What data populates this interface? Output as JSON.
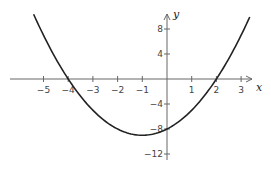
{
  "chart_data": {
    "type": "line",
    "title": "",
    "xlabel": "x",
    "ylabel": "y",
    "function": "y = x^2 + 2x - 8",
    "x_ticks": [
      -5,
      -4,
      -3,
      -2,
      -1,
      1,
      2,
      3
    ],
    "x_tick_labels": [
      "−5",
      "−4",
      "−3",
      "−2",
      "−1",
      "1",
      "2",
      "3"
    ],
    "y_ticks": [
      8,
      4,
      -4,
      -8,
      -12
    ],
    "y_tick_labels": [
      "8",
      "4",
      "−4",
      "−8",
      "−12"
    ],
    "xlim": [
      -6.3,
      3.5
    ],
    "ylim": [
      -13,
      12
    ],
    "grid": false,
    "series": [
      {
        "name": "parabola",
        "x": [
          -5.4,
          -5,
          -4,
          -3,
          -2,
          -1,
          0,
          1,
          2,
          3,
          3.35
        ],
        "y": [
          10.4,
          7,
          0,
          -5,
          -8,
          -9,
          -8,
          -5,
          0,
          7,
          9.9
        ]
      }
    ],
    "annotations": {
      "x_intercepts": [
        -4,
        2
      ],
      "y_intercept": -8,
      "vertex": [
        -1,
        -9
      ]
    },
    "colors": {
      "curve": "#222222",
      "axis": "#666666"
    }
  },
  "labels": {
    "x_axis": "x",
    "y_axis": "y"
  }
}
